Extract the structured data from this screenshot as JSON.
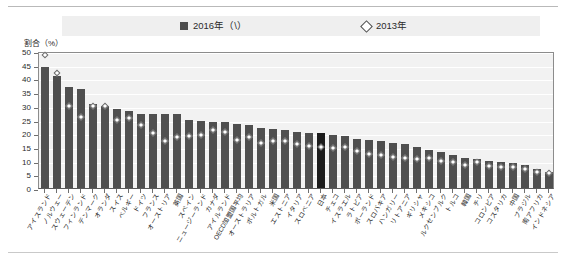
{
  "legend": {
    "series_2016": {
      "label": "2016年（\\）",
      "marker": "filled-square",
      "color": "#4f4f4f"
    },
    "series_2013": {
      "label": "2013年",
      "marker": "open-diamond",
      "color": "#ffffff"
    }
  },
  "axis_title": "割合（%）",
  "chart_data": {
    "type": "bar",
    "title": "",
    "subtitle": "",
    "xlabel": "",
    "ylabel": "割合（%）",
    "ylim": [
      0,
      50
    ],
    "ytick_step": 5,
    "yticks": [
      0,
      5,
      10,
      15,
      20,
      25,
      30,
      35,
      40,
      45,
      50
    ],
    "grid": true,
    "legend_position": "top",
    "highlight_category": "日本",
    "highlight_color": "#1c1c1c",
    "categories": [
      "アイスランド",
      "ノルウェー",
      "スウェーデン",
      "フィンランド",
      "デンマーク",
      "オランダ",
      "スイス",
      "ベルギー",
      "ドイツ",
      "フランス",
      "オーストリア",
      "英国",
      "スペイン",
      "ニュージーランド",
      "カナダ",
      "アイルランド",
      "OECD加盟国平均",
      "オーストラリア",
      "ポルトガル",
      "米国",
      "エストニア",
      "イタリア",
      "スロベニア",
      "日本",
      "チェコ",
      "イスラエル",
      "ラトビア",
      "ポーランド",
      "スロバキア",
      "ハンガリー",
      "リトアニア",
      "ギリシャ",
      "メキシコ",
      "ルクセンブルク",
      "トルコ",
      "韓国",
      "チリ",
      "コロンビア",
      "コスタリカ",
      "中国",
      "ブラジル",
      "南アフリカ",
      "インドネシア"
    ],
    "series": [
      {
        "name": "2016年（\\）",
        "marker": "bar",
        "values": [
          44,
          41,
          37,
          36,
          30.5,
          30,
          29,
          28,
          27,
          27,
          27,
          27,
          25,
          24.5,
          24,
          24,
          23.5,
          23,
          22,
          21.5,
          21,
          20.5,
          20,
          20,
          19.5,
          19,
          18,
          17.5,
          17,
          16.5,
          16,
          15,
          14,
          13,
          12,
          11,
          10.5,
          10,
          9.5,
          9,
          8.5,
          7,
          6
        ]
      },
      {
        "name": "2013年",
        "marker": "open-diamond",
        "values": [
          48.5,
          42,
          30,
          26,
          30,
          30,
          25,
          25.5,
          23,
          20,
          17,
          18.5,
          19,
          19.5,
          21,
          20.5,
          17.5,
          18.5,
          16.5,
          17,
          17,
          16,
          15.5,
          15,
          14.5,
          15,
          13.5,
          12.5,
          12,
          11.5,
          11,
          10.5,
          11,
          10,
          9.5,
          8.5,
          9.5,
          8,
          7.5,
          7.5,
          7,
          6,
          5.5
        ]
      }
    ],
    "annotations": [
      {
        "text": "2013年の外れ値",
        "category": "オーストラリア",
        "value": 25
      }
    ],
    "n_categories": 43
  }
}
